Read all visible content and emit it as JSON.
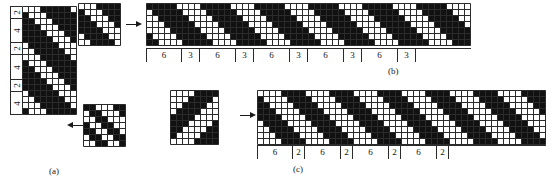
{
  "figure": {
    "kind": "weave-pattern-diagram",
    "captions": {
      "a": "(a)",
      "b": "(b)",
      "c": "(c)"
    },
    "colors": {
      "filled": "#111111",
      "empty": "#ffffff",
      "grid_line": "#2b2b2b",
      "ink": "#1a1a1a"
    }
  },
  "panel_a": {
    "caption": "(a)",
    "label_column": {
      "labels": [
        "2",
        "4",
        "2",
        "4",
        "2",
        "4"
      ],
      "orientation": "rotated-90"
    },
    "grid": {
      "cols": 9,
      "rows": 18,
      "cell": 6,
      "filled": [
        [
          0,
          0,
          0,
          1,
          1,
          1,
          1,
          1,
          0
        ],
        [
          1,
          0,
          0,
          0,
          1,
          1,
          1,
          1,
          1
        ],
        [
          1,
          1,
          0,
          0,
          0,
          1,
          1,
          1,
          1
        ],
        [
          1,
          1,
          1,
          0,
          0,
          0,
          1,
          1,
          1
        ],
        [
          1,
          1,
          1,
          1,
          0,
          0,
          0,
          1,
          1
        ],
        [
          1,
          1,
          1,
          1,
          1,
          0,
          0,
          0,
          1
        ],
        [
          0,
          1,
          1,
          1,
          1,
          1,
          0,
          0,
          0
        ],
        [
          0,
          0,
          1,
          1,
          1,
          1,
          1,
          0,
          0
        ],
        [
          0,
          0,
          0,
          1,
          1,
          1,
          1,
          1,
          0
        ],
        [
          1,
          0,
          0,
          0,
          1,
          1,
          1,
          1,
          1
        ],
        [
          1,
          1,
          0,
          0,
          0,
          1,
          1,
          1,
          1
        ],
        [
          1,
          1,
          1,
          0,
          0,
          0,
          1,
          1,
          1
        ],
        [
          1,
          1,
          1,
          1,
          0,
          0,
          0,
          1,
          1
        ],
        [
          1,
          1,
          1,
          1,
          1,
          0,
          0,
          0,
          1
        ],
        [
          0,
          1,
          1,
          1,
          1,
          1,
          0,
          0,
          0
        ],
        [
          0,
          0,
          1,
          1,
          1,
          1,
          1,
          0,
          0
        ],
        [
          0,
          0,
          0,
          1,
          1,
          1,
          1,
          1,
          0
        ],
        [
          1,
          0,
          0,
          0,
          1,
          1,
          1,
          1,
          1
        ]
      ]
    }
  },
  "panel_b": {
    "caption": "(b)",
    "source": {
      "cols": 7,
      "rows": 7,
      "cell": 6,
      "filled": [
        [
          0,
          0,
          0,
          1,
          1,
          1,
          1
        ],
        [
          1,
          0,
          0,
          0,
          1,
          1,
          1
        ],
        [
          1,
          1,
          0,
          0,
          0,
          1,
          1
        ],
        [
          1,
          1,
          1,
          0,
          0,
          0,
          1
        ],
        [
          1,
          1,
          1,
          1,
          0,
          0,
          0
        ],
        [
          0,
          1,
          1,
          1,
          1,
          0,
          0
        ],
        [
          0,
          0,
          1,
          1,
          1,
          1,
          0
        ]
      ]
    },
    "extended": {
      "cols": 54,
      "rows": 7,
      "cell": 6,
      "pattern_period": 9,
      "filled_rule": "diagonal twill repeat"
    },
    "ruler": {
      "labels": [
        "6",
        "3",
        "6",
        "3",
        "6",
        "3",
        "6",
        "3",
        "6",
        "3"
      ],
      "widths": [
        36,
        18,
        36,
        18,
        36,
        18,
        36,
        18,
        36,
        18
      ]
    },
    "arrow": {
      "direction": "right"
    }
  },
  "panel_c": {
    "caption": "(c)",
    "source": {
      "cols": 8,
      "rows": 9,
      "cell": 6,
      "filled": [
        [
          0,
          0,
          0,
          0,
          1,
          1,
          1,
          1
        ],
        [
          0,
          0,
          0,
          1,
          1,
          1,
          1,
          0
        ],
        [
          0,
          0,
          1,
          1,
          1,
          1,
          0,
          0
        ],
        [
          0,
          1,
          1,
          1,
          1,
          0,
          0,
          0
        ],
        [
          1,
          1,
          1,
          1,
          0,
          0,
          0,
          0
        ],
        [
          1,
          1,
          1,
          0,
          0,
          0,
          0,
          1
        ],
        [
          1,
          1,
          0,
          0,
          0,
          0,
          1,
          1
        ],
        [
          1,
          0,
          0,
          0,
          0,
          1,
          1,
          1
        ],
        [
          0,
          0,
          0,
          0,
          1,
          1,
          1,
          1
        ]
      ]
    },
    "extended": {
      "cols": 48,
      "rows": 9,
      "cell": 6,
      "pattern_period": 8,
      "filled_rule": "diagonal twill repeat"
    },
    "ruler": {
      "labels": [
        "6",
        "2",
        "6",
        "2",
        "6",
        "2",
        "6",
        "2"
      ],
      "widths": [
        36,
        12,
        36,
        12,
        36,
        12,
        36,
        12
      ]
    },
    "arrow": {
      "direction": "right"
    }
  },
  "panel_a_source": {
    "grid": {
      "cols": 7,
      "rows": 7,
      "cell": 6,
      "filled": [
        [
          1,
          1,
          0,
          0,
          0,
          1,
          1
        ],
        [
          0,
          1,
          1,
          0,
          0,
          0,
          1
        ],
        [
          0,
          0,
          1,
          1,
          0,
          0,
          0
        ],
        [
          1,
          0,
          0,
          1,
          1,
          0,
          0
        ],
        [
          1,
          1,
          0,
          0,
          1,
          1,
          0
        ],
        [
          0,
          1,
          1,
          0,
          0,
          1,
          1
        ],
        [
          0,
          0,
          1,
          1,
          0,
          0,
          1
        ]
      ]
    },
    "arrow": {
      "direction": "left"
    }
  }
}
